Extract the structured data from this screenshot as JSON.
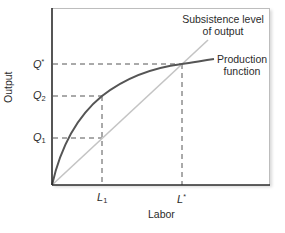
{
  "diagram": {
    "x_axis": {
      "label": "Labor",
      "ticks": [
        {
          "base": "L",
          "sub": "1",
          "sup": ""
        },
        {
          "base": "L",
          "sub": "",
          "sup": "*"
        }
      ]
    },
    "y_axis": {
      "label": "Output",
      "ticks": [
        {
          "base": "Q",
          "sub": "",
          "sup": "*"
        },
        {
          "base": "Q",
          "sub": "2",
          "sup": ""
        },
        {
          "base": "Q",
          "sub": "1",
          "sup": ""
        }
      ]
    },
    "curves": {
      "subsistence": {
        "line1": "Subsistence level",
        "line2": "of output",
        "color": "#c4c4c4"
      },
      "production": {
        "line1": "Production",
        "line2": "function",
        "color": "#555555"
      }
    },
    "colors": {
      "axis": "#2b2b2b",
      "dashed": "#555555",
      "frame": "#bdbdbd"
    }
  }
}
